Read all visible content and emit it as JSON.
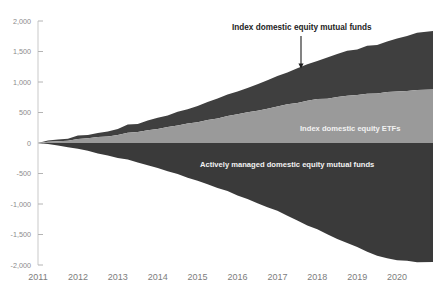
{
  "chart_data": {
    "type": "area",
    "title": "",
    "xlabel": "",
    "ylabel": "",
    "stacked": true,
    "grid": false,
    "legend_position": "inline-annotations",
    "xlim": [
      2011,
      2020.9
    ],
    "ylim": [
      -2000,
      2000
    ],
    "ytick_labels": [
      "2,000",
      "1,500",
      "1,000",
      "500",
      "0",
      "-500",
      "-1,000",
      "-1,500",
      "-2,000"
    ],
    "ytick_values": [
      2000,
      1500,
      1000,
      500,
      0,
      -500,
      -1000,
      -1500,
      -2000
    ],
    "xtick_labels": [
      "2011",
      "2012",
      "2013",
      "2014",
      "2015",
      "2016",
      "2017",
      "2018",
      "2019",
      "2020"
    ],
    "xtick_values": [
      2011,
      2012,
      2013,
      2014,
      2015,
      2016,
      2017,
      2018,
      2019,
      2020
    ],
    "x": [
      2011.0,
      2011.25,
      2011.5,
      2011.75,
      2012.0,
      2012.25,
      2012.5,
      2012.75,
      2013.0,
      2013.25,
      2013.5,
      2013.75,
      2014.0,
      2014.25,
      2014.5,
      2014.75,
      2015.0,
      2015.25,
      2015.5,
      2015.75,
      2016.0,
      2016.25,
      2016.5,
      2016.75,
      2017.0,
      2017.25,
      2017.5,
      2017.75,
      2018.0,
      2018.25,
      2018.5,
      2018.75,
      2019.0,
      2019.25,
      2019.5,
      2019.75,
      2020.0,
      2020.25,
      2020.5,
      2020.9
    ],
    "series": [
      {
        "name": "Index domestic equity mutual funds",
        "color": "#3f3f3f",
        "values": [
          0,
          12,
          24,
          36,
          50,
          64,
          78,
          92,
          108,
          124,
          142,
          160,
          180,
          200,
          222,
          244,
          268,
          292,
          318,
          344,
          372,
          400,
          430,
          462,
          496,
          530,
          566,
          600,
          636,
          668,
          700,
          726,
          752,
          778,
          806,
          836,
          866,
          900,
          934,
          968
        ]
      },
      {
        "name": "Index domestic equity ETFs",
        "color": "#9a9a9a",
        "values": [
          0,
          14,
          28,
          44,
          60,
          78,
          96,
          116,
          138,
          160,
          184,
          208,
          234,
          260,
          288,
          316,
          346,
          376,
          406,
          436,
          468,
          500,
          532,
          564,
          596,
          628,
          658,
          686,
          712,
          734,
          754,
          772,
          790,
          806,
          820,
          834,
          846,
          858,
          870,
          884
        ]
      },
      {
        "name": "Actively managed domestic equity mutual funds",
        "color": "#3a3a3a",
        "values": [
          0,
          -22,
          -46,
          -72,
          -100,
          -132,
          -166,
          -202,
          -240,
          -280,
          -322,
          -366,
          -412,
          -460,
          -510,
          -562,
          -616,
          -672,
          -730,
          -790,
          -852,
          -916,
          -982,
          -1050,
          -1120,
          -1192,
          -1266,
          -1342,
          -1420,
          -1496,
          -1570,
          -1642,
          -1712,
          -1780,
          -1842,
          -1892,
          -1920,
          -1936,
          -1946,
          -1952
        ]
      }
    ],
    "annotations": [
      {
        "name": "index-mutual-funds-annotation",
        "text": "Index domestic equity mutual funds",
        "style": "dark-with-arrow",
        "text_x": 232,
        "text_y": 30,
        "arrow_x": 301,
        "arrow_y1": 36,
        "arrow_y2": 67
      },
      {
        "name": "index-etfs-annotation",
        "text": "Index domestic equity ETFs",
        "style": "light-inline",
        "text_x": 300,
        "text_y": 131
      },
      {
        "name": "actively-managed-annotation",
        "text": "Actively managed domestic equity mutual funds",
        "style": "light-inline",
        "text_x": 200,
        "text_y": 167
      }
    ]
  }
}
